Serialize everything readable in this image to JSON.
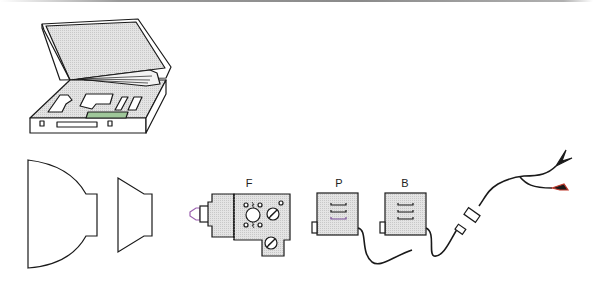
{
  "figure": {
    "labels": {
      "f": "F",
      "p": "P",
      "b": "B"
    },
    "components": [
      {
        "id": "case",
        "desc": "open carrying case with foam inserts"
      },
      {
        "id": "reflector-large",
        "desc": "large reflector"
      },
      {
        "id": "reflector-small",
        "desc": "small reflector"
      },
      {
        "id": "flash-head",
        "label": "F"
      },
      {
        "id": "power-pack-p",
        "label": "P"
      },
      {
        "id": "power-pack-b",
        "label": "B"
      },
      {
        "id": "cable-with-clips",
        "desc": "connector cable with alligator clips"
      }
    ],
    "colors": {
      "line": "#1a1a1a",
      "fill_gray": "#dcdcdc",
      "background": "#ffffff",
      "accent_green": "#9fc79a",
      "accent_purple": "#9b5fb0",
      "accent_red": "#c0392b"
    }
  }
}
